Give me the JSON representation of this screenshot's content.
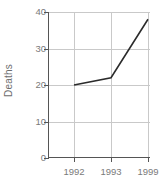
{
  "chart_data": {
    "type": "line",
    "title": "",
    "xlabel": "",
    "ylabel": "Deaths",
    "categories": [
      "1992",
      "1993",
      "1999"
    ],
    "x": [
      1992,
      1993,
      1999
    ],
    "values": [
      20,
      22,
      38
    ],
    "series": [
      {
        "name": "Deaths",
        "values": [
          20,
          22,
          38
        ]
      }
    ],
    "ylim": [
      0,
      40
    ],
    "yticks": [
      0,
      10,
      20,
      30,
      40
    ],
    "ytick_labels": [
      "0",
      "10",
      "20",
      "30",
      "40"
    ],
    "xticks": [
      1992,
      1993,
      1999
    ],
    "xtick_labels": [
      "1992",
      "1993",
      "1999"
    ],
    "grid": true,
    "legend": false,
    "legend_position": "none",
    "line_color": "#2b2b2b",
    "grid_color": "#c9c9c9",
    "axis_color": "#555555",
    "tick_label_color": "#7a7a7a",
    "background_color": "#ffffff"
  }
}
